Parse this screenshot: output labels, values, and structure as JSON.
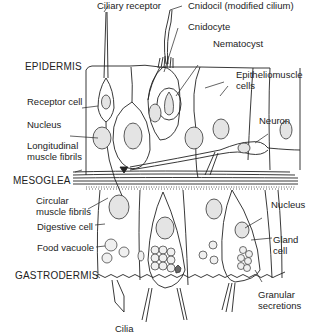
{
  "diagram": {
    "type": "labeled-biological-cross-section",
    "layers": {
      "epidermis": "EPIDERMIS",
      "mesoglea": "MESOGLEA",
      "gastrodermis": "GASTRODERMIS"
    },
    "labels": {
      "ciliary_receptor": "Ciliary receptor",
      "cnidocil": "Cnidocil (modified cilium)",
      "cnidocyte": "Cnidocyte",
      "nematocyst": "Nematocyst",
      "epitheliomuscle_1": "Epitheliomuscle",
      "epitheliomuscle_2": "cells",
      "receptor_cell": "Receptor cell",
      "nucleus_left": "Nucleus",
      "longitudinal_1": "Longitudinal",
      "longitudinal_2": "muscle fibrils",
      "neuron": "Neuron",
      "circular_1": "Circular",
      "circular_2": "muscle fibrils",
      "digestive_cell": "Digestive cell",
      "food_vacuole": "Food vacuole",
      "nucleus_right": "Nucleus",
      "gland_1": "Gland",
      "gland_2": "cell",
      "cilia": "Cilia",
      "granular_1": "Granular",
      "granular_2": "secretions"
    },
    "colors": {
      "line": "#222222",
      "nucleus_fill": "#e4e4e4",
      "background": "#ffffff"
    }
  }
}
